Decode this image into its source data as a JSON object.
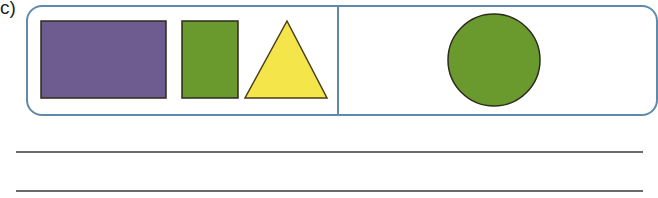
{
  "exercise": {
    "label": "c)",
    "panels": [
      {
        "id": "left",
        "shapes": [
          {
            "type": "rectangle",
            "name": "purple-rectangle",
            "color": "#6e5b8f"
          },
          {
            "type": "rectangle",
            "name": "green-rectangle",
            "color": "#6a9a2e"
          },
          {
            "type": "triangle",
            "name": "yellow-triangle",
            "color": "#f4e64a"
          }
        ]
      },
      {
        "id": "right",
        "shapes": [
          {
            "type": "circle",
            "name": "green-circle",
            "color": "#6a9a2e"
          }
        ]
      }
    ],
    "answer_lines": 2
  },
  "colors": {
    "border": "#5f8aab",
    "outline": "#2d2a1e",
    "rule": "#6a6a6a"
  }
}
